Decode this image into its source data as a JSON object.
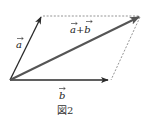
{
  "figure": {
    "caption": "図2",
    "vectors": {
      "a": {
        "label": "a",
        "from": [
          10,
          80
        ],
        "to": [
          42,
          16
        ]
      },
      "b": {
        "label": "b",
        "from": [
          10,
          80
        ],
        "to": [
          110,
          80
        ]
      },
      "sum": {
        "label": "a+b",
        "from": [
          10,
          80
        ],
        "to": [
          141,
          16
        ]
      }
    },
    "dashed_edges": [
      {
        "from": [
          42,
          16
        ],
        "to": [
          141,
          16
        ]
      },
      {
        "from": [
          141,
          16
        ],
        "to": [
          110,
          80
        ]
      }
    ],
    "colors": {
      "vector_a": "#2a2a2a",
      "vector_b": "#2a2a2a",
      "vector_sum": "#555555",
      "dashed": "#888888"
    }
  }
}
